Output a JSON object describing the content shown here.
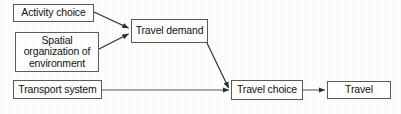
{
  "diagram": {
    "canvas": {
      "width": 401,
      "height": 114
    },
    "style": {
      "background_color": "#fdfdfc",
      "box_border_color": "#59595b",
      "box_fill_color": "#fefefe",
      "edge_color": "#2b2b2b",
      "text_color": "#111111"
    },
    "nodes": [
      {
        "id": "activity_choice",
        "label": "Activity choice",
        "x": 13,
        "y": 4,
        "width": 81,
        "height": 18
      },
      {
        "id": "spatial_organization",
        "label": "Spatial\norganization of\nenvironment",
        "x": 15,
        "y": 32,
        "width": 84,
        "height": 40
      },
      {
        "id": "transport_system",
        "label": "Transport system",
        "x": 13,
        "y": 80,
        "width": 89,
        "height": 19
      },
      {
        "id": "travel_demand",
        "label": "Travel demand",
        "x": 131,
        "y": 19,
        "width": 77,
        "height": 24
      },
      {
        "id": "travel_choice",
        "label": "Travel choice",
        "x": 231,
        "y": 80,
        "width": 72,
        "height": 20
      },
      {
        "id": "travel",
        "label": "Travel",
        "x": 327,
        "y": 81,
        "width": 64,
        "height": 18
      }
    ],
    "edges": [
      {
        "id": "activity_to_demand",
        "from": "activity_choice",
        "to": "travel_demand",
        "kind": "diagonal",
        "arrowhead": "filled-triangle",
        "points": "94,12 129,28"
      },
      {
        "id": "spatial_to_demand",
        "from": "spatial_organization",
        "to": "travel_demand",
        "kind": "diagonal",
        "arrowhead": "filled-triangle",
        "points": "99,49 129,34"
      },
      {
        "id": "demand_to_choice",
        "from": "travel_demand",
        "to": "travel_choice",
        "kind": "diagonal",
        "arrowhead": "filled-triangle",
        "points": "207,43 229,88"
      },
      {
        "id": "transport_to_choice",
        "from": "transport_system",
        "to": "travel_choice",
        "kind": "horizontal",
        "arrowhead": "filled-triangle",
        "points": "102,90 229,90"
      },
      {
        "id": "choice_to_travel",
        "from": "travel_choice",
        "to": "travel",
        "kind": "horizontal",
        "arrowhead": "filled-triangle",
        "points": "303,90 325,90"
      }
    ]
  }
}
